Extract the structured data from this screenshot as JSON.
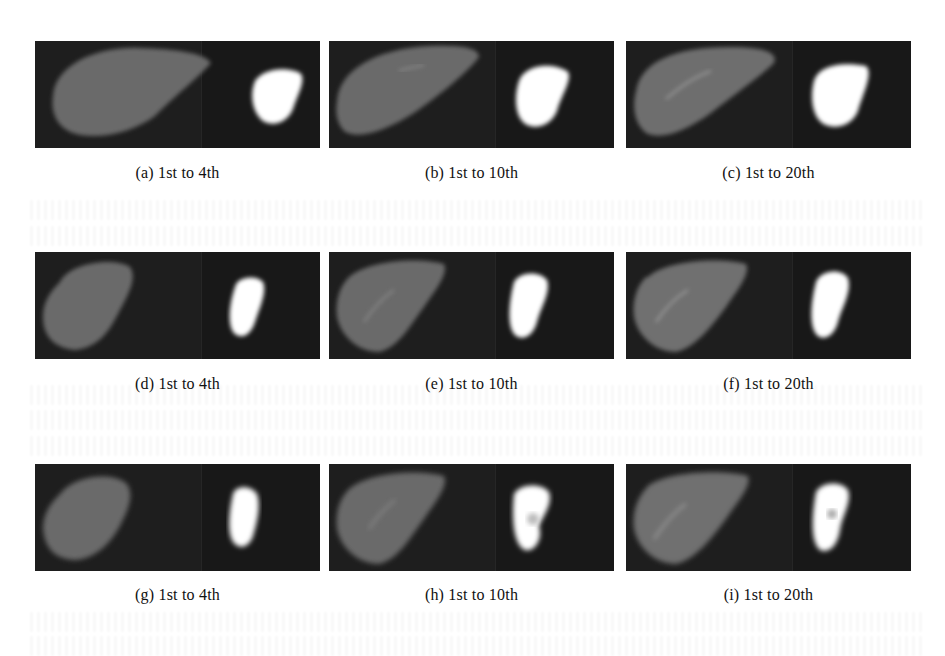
{
  "figure": {
    "rows": [
      {
        "panels": [
          {
            "id": "a",
            "caption": "(a) 1st to 4th",
            "liver_shape": "oval",
            "seg_shape": "blob"
          },
          {
            "id": "b",
            "caption": "(b) 1st to 10th",
            "liver_shape": "oval",
            "seg_shape": "blob"
          },
          {
            "id": "c",
            "caption": "(c) 1st to 20th",
            "liver_shape": "oval",
            "seg_shape": "blob"
          }
        ]
      },
      {
        "panels": [
          {
            "id": "d",
            "caption": "(d) 1st to 4th",
            "liver_shape": "tall",
            "seg_shape": "tall"
          },
          {
            "id": "e",
            "caption": "(e) 1st to 10th",
            "liver_shape": "tall",
            "seg_shape": "tall"
          },
          {
            "id": "f",
            "caption": "(f) 1st to 20th",
            "liver_shape": "tall",
            "seg_shape": "tall"
          }
        ]
      },
      {
        "panels": [
          {
            "id": "g",
            "caption": "(g) 1st to 4th",
            "liver_shape": "tall",
            "seg_shape": "tall"
          },
          {
            "id": "h",
            "caption": "(h) 1st to 10th",
            "liver_shape": "tall",
            "seg_shape": "tall"
          },
          {
            "id": "i",
            "caption": "(i) 1st to 20th",
            "liver_shape": "tall",
            "seg_shape": "tall"
          }
        ]
      }
    ],
    "colors": {
      "page_background": "#ffffff",
      "image_background": "#1c1c1c",
      "liver_tissue": "#6e6e6e",
      "segmentation": "#ffffff",
      "caption_text": "#111111"
    }
  }
}
